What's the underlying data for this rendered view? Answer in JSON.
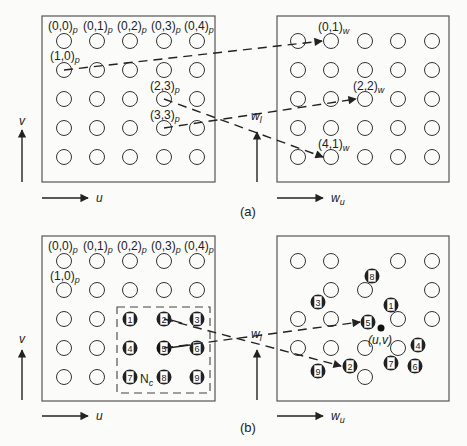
{
  "figure": {
    "panel_a": {
      "caption": "(a)",
      "left_grid": {
        "axis_x": "u",
        "axis_y": "v",
        "labels": [
          {
            "text": "(0,0)",
            "sub": "p"
          },
          {
            "text": "(0,1)",
            "sub": "p"
          },
          {
            "text": "(0,2)",
            "sub": "p"
          },
          {
            "text": "(0,3)",
            "sub": "p"
          },
          {
            "text": "(0,4)",
            "sub": "p"
          },
          {
            "text": "(1,0)",
            "sub": "p"
          },
          {
            "text": "(2,3)",
            "sub": "p"
          },
          {
            "text": "(3,3)",
            "sub": "p"
          }
        ]
      },
      "right_grid": {
        "axis_x": "w",
        "axis_x_sub": "u",
        "axis_y": "w",
        "axis_y_sub": "l",
        "labels": [
          {
            "text": "(0,1)",
            "sub": "w"
          },
          {
            "text": "(2,2)",
            "sub": "w"
          },
          {
            "text": "(4,1)",
            "sub": "w"
          }
        ]
      },
      "mappings": [
        {
          "from": "(1,0)p",
          "to": "(0,1)w"
        },
        {
          "from": "(2,3)p",
          "to": "(4,1)w"
        },
        {
          "from": "(3,3)p",
          "to": "(2,2)w"
        }
      ]
    },
    "panel_b": {
      "caption": "(b)",
      "left_grid": {
        "axis_x": "u",
        "axis_y": "v",
        "labels": [
          {
            "text": "(0,0)",
            "sub": "p"
          },
          {
            "text": "(0,1)",
            "sub": "p"
          },
          {
            "text": "(0,2)",
            "sub": "p"
          },
          {
            "text": "(0,3)",
            "sub": "p"
          },
          {
            "text": "(0,4)",
            "sub": "p"
          },
          {
            "text": "(1,0)",
            "sub": "p"
          }
        ],
        "neighborhood_label": "N",
        "neighborhood_sub": "c",
        "neighborhood_numbers": [
          "1",
          "2",
          "3",
          "4",
          "5",
          "6",
          "7",
          "8",
          "9"
        ]
      },
      "right_grid": {
        "axis_x": "w",
        "axis_x_sub": "u",
        "axis_y": "w",
        "axis_y_sub": "l",
        "point_label": "(u,v)",
        "scattered_numbers": [
          "1",
          "2",
          "3",
          "4",
          "5",
          "6",
          "7",
          "8",
          "9"
        ]
      }
    },
    "colors": {
      "ink": "#222222",
      "paper": "#fbfbf9",
      "box": "#555555"
    }
  }
}
